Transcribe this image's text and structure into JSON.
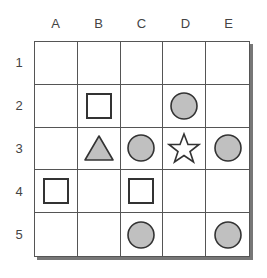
{
  "columns": [
    "A",
    "B",
    "C",
    "D",
    "E"
  ],
  "rows": [
    "1",
    "2",
    "3",
    "4",
    "5"
  ],
  "colors": {
    "fill_gray": "#c0c0c0",
    "stroke": "#333333",
    "grid": "#555555"
  },
  "pieces": [
    {
      "row": 2,
      "col": "B",
      "shape": "square"
    },
    {
      "row": 2,
      "col": "D",
      "shape": "circle"
    },
    {
      "row": 3,
      "col": "B",
      "shape": "triangle"
    },
    {
      "row": 3,
      "col": "C",
      "shape": "circle"
    },
    {
      "row": 3,
      "col": "D",
      "shape": "star"
    },
    {
      "row": 3,
      "col": "E",
      "shape": "circle"
    },
    {
      "row": 4,
      "col": "A",
      "shape": "square"
    },
    {
      "row": 4,
      "col": "C",
      "shape": "square"
    },
    {
      "row": 5,
      "col": "C",
      "shape": "circle"
    },
    {
      "row": 5,
      "col": "E",
      "shape": "circle"
    }
  ]
}
